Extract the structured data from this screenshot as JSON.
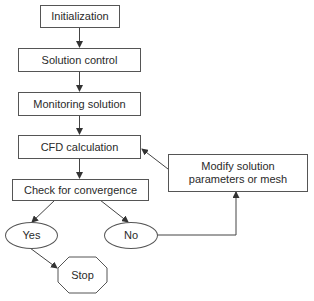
{
  "diagram": {
    "type": "flowchart",
    "nodes": {
      "initialization": {
        "label": "Initialization",
        "shape": "rectangle"
      },
      "solution_control": {
        "label": "Solution control",
        "shape": "rectangle"
      },
      "monitoring_solution": {
        "label": "Monitoring solution",
        "shape": "rectangle"
      },
      "cfd_calculation": {
        "label": "CFD calculation",
        "shape": "rectangle"
      },
      "check_convergence": {
        "label": "Check for convergence",
        "shape": "rectangle"
      },
      "modify": {
        "label_line1": "Modify solution",
        "label_line2": "parameters or mesh",
        "shape": "rectangle"
      },
      "yes": {
        "label": "Yes",
        "shape": "ellipse"
      },
      "no": {
        "label": "No",
        "shape": "ellipse"
      },
      "stop": {
        "label": "Stop",
        "shape": "octagon"
      }
    },
    "edges": [
      {
        "from": "Initialization",
        "to": "Solution control"
      },
      {
        "from": "Solution control",
        "to": "Monitoring solution"
      },
      {
        "from": "Monitoring solution",
        "to": "CFD calculation"
      },
      {
        "from": "CFD calculation",
        "to": "Check for convergence"
      },
      {
        "from": "Check for convergence",
        "to": "Yes"
      },
      {
        "from": "Check for convergence",
        "to": "No"
      },
      {
        "from": "Yes",
        "to": "Stop"
      },
      {
        "from": "No",
        "to": "Modify solution parameters or mesh"
      },
      {
        "from": "Modify solution parameters or mesh",
        "to": "CFD calculation"
      }
    ],
    "colors": {
      "stroke": "#555555",
      "text": "#2a2a2a",
      "background": "#ffffff"
    }
  }
}
